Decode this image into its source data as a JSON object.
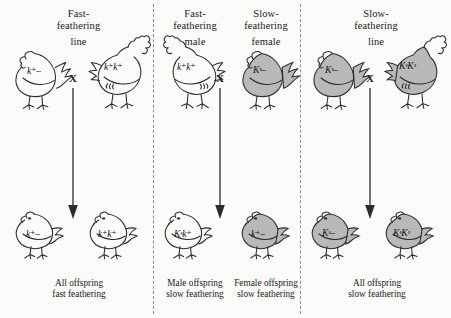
{
  "figure": {
    "background": "#fbfbfa",
    "shaded_fill": "#b9b9b9",
    "outline": "#2b2b2b"
  },
  "symbols": {
    "cross": "X",
    "k_plus": "k",
    "k_plus_sup": "+",
    "K_slow": "K",
    "K_slow_sup": "s",
    "hemizygous_dash": "–"
  },
  "panels": [
    {
      "id": "left",
      "header": {
        "line1": "Fast-",
        "line2": "feathering",
        "line3": "line"
      },
      "header_mode": "single",
      "parents": [
        {
          "role": "female",
          "sex": "hen",
          "shaded": false,
          "genotype": "k⁺–"
        },
        {
          "role": "male",
          "sex": "rooster",
          "shaded": false,
          "genotype": "k⁺k⁺"
        }
      ],
      "offspring": [
        {
          "shaded": false,
          "genotype": "k⁺–"
        },
        {
          "shaded": false,
          "genotype": "k⁺k⁺"
        }
      ],
      "captions": [
        {
          "line1": "All offspring",
          "line2": "fast feathering"
        }
      ]
    },
    {
      "id": "middle",
      "header_mode": "dual",
      "header_left": {
        "line1": "Fast-",
        "line2": "feathering",
        "line3": "male"
      },
      "header_right": {
        "line1": "Slow-",
        "line2": "feathering",
        "line3": "female"
      },
      "parents": [
        {
          "role": "male",
          "sex": "rooster",
          "shaded": false,
          "genotype": "k⁺k⁺"
        },
        {
          "role": "female",
          "sex": "hen",
          "shaded": true,
          "genotype": "Kˢ–"
        }
      ],
      "offspring": [
        {
          "shaded": false,
          "genotype": "Kˢk⁺"
        },
        {
          "shaded": true,
          "genotype": "k⁺–"
        }
      ],
      "captions": [
        {
          "line1": "Male offspring",
          "line2": "slow feathering"
        },
        {
          "line1": "Female offspring",
          "line2": "slow feathering"
        }
      ]
    },
    {
      "id": "right",
      "header": {
        "line1": "Slow-",
        "line2": "feathering",
        "line3": "line"
      },
      "header_mode": "single",
      "parents": [
        {
          "role": "female",
          "sex": "hen",
          "shaded": true,
          "genotype": "Kˢ–"
        },
        {
          "role": "male",
          "sex": "rooster",
          "shaded": true,
          "genotype": "KˢKˢ"
        }
      ],
      "offspring": [
        {
          "shaded": true,
          "genotype": "Kˢ–"
        },
        {
          "shaded": true,
          "genotype": "KˢKˢ"
        }
      ],
      "captions": [
        {
          "line1": "All offspring",
          "line2": "slow feathering"
        }
      ]
    }
  ]
}
